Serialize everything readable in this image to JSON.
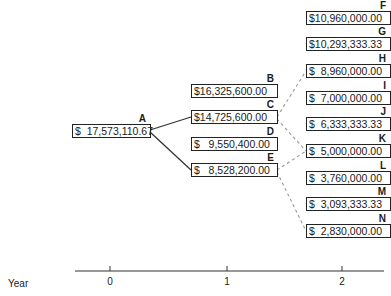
{
  "axis": {
    "label": "Year",
    "ticks": [
      "0",
      "1",
      "2"
    ]
  },
  "nodes": {
    "A": {
      "label": "A",
      "value": "$  17,573,110.67"
    },
    "B": {
      "label": "B",
      "value": "$16,325,600.00"
    },
    "C": {
      "label": "C",
      "value": "$14,725,600.00"
    },
    "D": {
      "label": "D",
      "value": "$   9,550,400.00"
    },
    "E": {
      "label": "E",
      "value": "$   8,528,200.00"
    },
    "F": {
      "label": "F",
      "value": "$10,960,000.00"
    },
    "G": {
      "label": "G",
      "value": "$10,293,333.33"
    },
    "H": {
      "label": "H",
      "value": "$  8,960,000.00"
    },
    "I": {
      "label": "I",
      "value": "$  7,000,000.00"
    },
    "J": {
      "label": "J",
      "value": "$  6,333,333.33"
    },
    "K": {
      "label": "K",
      "value": "$  5,000,000.00"
    },
    "L": {
      "label": "L",
      "value": "$  3,760,000.00"
    },
    "M": {
      "label": "M",
      "value": "$  3,093,333.33"
    },
    "N": {
      "label": "N",
      "value": "$  2,830,000.00"
    }
  },
  "edges": {
    "solid": [
      [
        "A",
        "C"
      ],
      [
        "A",
        "E"
      ]
    ],
    "dashed": [
      [
        "C",
        "H"
      ],
      [
        "C",
        "K"
      ],
      [
        "E",
        "K"
      ],
      [
        "E",
        "N"
      ]
    ]
  },
  "colors": {
    "line": "#333333",
    "dashed_line": "#999999",
    "box_border": "#222222"
  }
}
